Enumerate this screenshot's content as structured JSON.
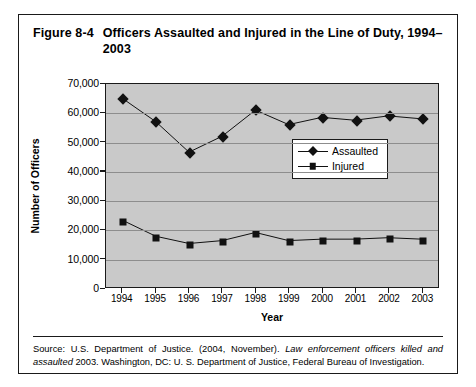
{
  "figure": {
    "number": "Figure 8-4",
    "title": "Officers Assaulted and Injured in the Line of Duty, 1994–2003"
  },
  "source": {
    "prefix": "Source: U.S. Department of Justice. (2004, November). ",
    "italic_title": "Law enforcement officers killed and assaulted",
    "suffix": " 2003. Washington, DC: U. S. Department of Justice, Federal Bureau of Investigation."
  },
  "legend": {
    "position": "inside-right",
    "entries": [
      {
        "label": "Assaulted",
        "marker": "diamond-marker"
      },
      {
        "label": "Injured",
        "marker": "square-marker"
      }
    ]
  },
  "chart_data": {
    "type": "line",
    "title": "Officers Assaulted and Injured in the Line of Duty, 1994–2003",
    "xlabel": "Year",
    "ylabel": "Number of Officers",
    "categories": [
      "1994",
      "1995",
      "1996",
      "1997",
      "1998",
      "1999",
      "2000",
      "2001",
      "2002",
      "2003"
    ],
    "ylim": [
      0,
      70000
    ],
    "ytick_values": [
      0,
      10000,
      20000,
      30000,
      40000,
      50000,
      60000,
      70000
    ],
    "ytick_labels": [
      "0",
      "10,000",
      "20,000",
      "30,000",
      "40,000",
      "50,000",
      "60,000",
      "70,000"
    ],
    "grid": true,
    "plot_background": "#c9c9c9",
    "series": [
      {
        "name": "Assaulted",
        "marker": "diamond",
        "color": "#111111",
        "values": [
          65000,
          57000,
          46500,
          52000,
          61000,
          56000,
          58500,
          57500,
          59000,
          58000
        ]
      },
      {
        "name": "Injured",
        "marker": "square",
        "color": "#111111",
        "values": [
          23000,
          17500,
          15000,
          16000,
          18800,
          16000,
          16500,
          16500,
          17000,
          16500
        ]
      }
    ]
  }
}
